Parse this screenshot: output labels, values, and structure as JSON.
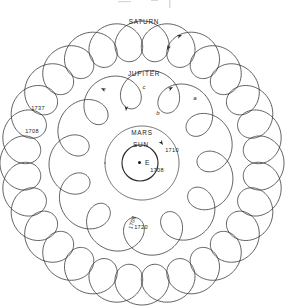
{
  "figure": {
    "title_fragment": "",
    "background_color": "#ffffff",
    "stroke_color": "#2b2b2b",
    "width": 285,
    "height": 306,
    "center": {
      "x": 142,
      "y": 163
    }
  },
  "bodies": {
    "saturn": {
      "label": "SATURN",
      "label_x": 144,
      "label_y": 24,
      "loops": 29,
      "base_radius": 122,
      "loop_radius": 20
    },
    "jupiter": {
      "label": "JUPITER",
      "label_x": 144,
      "label_y": 76,
      "loops": 12,
      "base_radius": 74,
      "loop_radius": 19
    },
    "mars": {
      "label": "MARS",
      "label_x": 142,
      "label_y": 135,
      "loops": 1,
      "base_radius": 30,
      "loop_radius": 7
    },
    "sun": {
      "label": "SUN",
      "label_x": 141,
      "label_y": 147,
      "base_radius": 18
    },
    "earth": {
      "label": "E",
      "label_x": 145,
      "label_y": 165,
      "dot_x": 139.5,
      "dot_y": 162.5
    }
  },
  "year_labels": [
    {
      "id": "saturn-1737",
      "text": "1737",
      "x": 38,
      "y": 110,
      "rotate": 0
    },
    {
      "id": "saturn-1708",
      "text": "1708",
      "x": 32,
      "y": 133,
      "rotate": 0
    },
    {
      "id": "mars-1710",
      "text": "1710",
      "x": 172,
      "y": 152,
      "rotate": 0
    },
    {
      "id": "mars-1708",
      "text": "1708",
      "x": 157,
      "y": 172,
      "rotate": 0
    },
    {
      "id": "jupiter-1708",
      "text": "1708",
      "x": 134,
      "y": 223,
      "rotate": -72
    },
    {
      "id": "jupiter-1720",
      "text": "1720",
      "x": 141,
      "y": 229,
      "rotate": 0
    }
  ],
  "node_labels": [
    {
      "id": "node-a",
      "text": "a",
      "x": 195,
      "y": 100
    },
    {
      "id": "node-b",
      "text": "b",
      "x": 158,
      "y": 115
    },
    {
      "id": "node-c",
      "text": "c",
      "x": 144,
      "y": 89
    }
  ],
  "arrows": [
    {
      "id": "arrow-saturn",
      "x": 182,
      "y": 35,
      "angle": -22
    },
    {
      "id": "arrow-saturn-2",
      "x": 167,
      "y": 50,
      "angle": 118
    },
    {
      "id": "arrow-jupiter",
      "x": 101,
      "y": 88,
      "angle": 208
    },
    {
      "id": "arrow-jupiter-2",
      "x": 126,
      "y": 111,
      "angle": 95
    },
    {
      "id": "arrow-jupiter-3",
      "x": 173,
      "y": 87,
      "angle": -30
    },
    {
      "id": "arrow-mars",
      "x": 163,
      "y": 145,
      "angle": 55
    }
  ]
}
